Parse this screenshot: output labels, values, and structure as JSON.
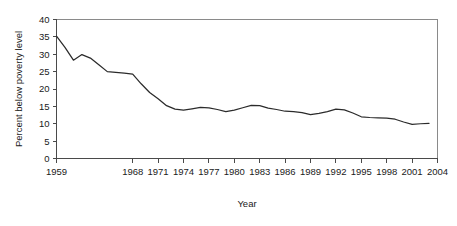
{
  "chart_data": {
    "type": "line",
    "title": "",
    "xlabel": "Year",
    "ylabel": "Percent below poverty level",
    "xlim": [
      1959,
      2004
    ],
    "ylim": [
      0,
      40
    ],
    "grid": false,
    "legend": null,
    "x_ticks": [
      "1959",
      "1968",
      "1971",
      "1974",
      "1977",
      "1980",
      "1983",
      "1986",
      "1989",
      "1992",
      "1995",
      "1998",
      "2001",
      "2004"
    ],
    "x_tick_values": [
      1959,
      1968,
      1971,
      1974,
      1977,
      1980,
      1983,
      1986,
      1989,
      1992,
      1995,
      1998,
      2001,
      2004
    ],
    "y_ticks": [
      "0",
      "5",
      "10",
      "15",
      "20",
      "25",
      "30",
      "35",
      "40"
    ],
    "y_tick_values": [
      0,
      5,
      10,
      15,
      20,
      25,
      30,
      35,
      40
    ],
    "line_color": "#2b2b2b",
    "x": [
      1959,
      1960,
      1961,
      1962,
      1963,
      1964,
      1965,
      1966,
      1967,
      1968,
      1969,
      1970,
      1971,
      1972,
      1973,
      1974,
      1975,
      1976,
      1977,
      1978,
      1979,
      1980,
      1981,
      1982,
      1983,
      1984,
      1985,
      1986,
      1987,
      1988,
      1989,
      1990,
      1991,
      1992,
      1993,
      1994,
      1995,
      1996,
      1997,
      1998,
      1999,
      2000,
      2001,
      2002,
      2003
    ],
    "values": [
      35.2,
      32.0,
      28.3,
      29.9,
      28.9,
      27.0,
      25.0,
      24.8,
      24.6,
      24.3,
      21.5,
      19.0,
      17.2,
      15.2,
      14.2,
      13.9,
      14.3,
      14.7,
      14.6,
      14.1,
      13.5,
      13.9,
      14.6,
      15.3,
      15.2,
      14.5,
      14.1,
      13.6,
      13.5,
      13.2,
      12.6,
      13.0,
      13.5,
      14.2,
      14.0,
      13.1,
      12.0,
      11.8,
      11.7,
      11.6,
      11.3,
      10.5,
      9.8,
      10.0,
      10.1
    ]
  },
  "axis": {
    "y_title": "Percent below poverty level",
    "x_title": "Year"
  }
}
